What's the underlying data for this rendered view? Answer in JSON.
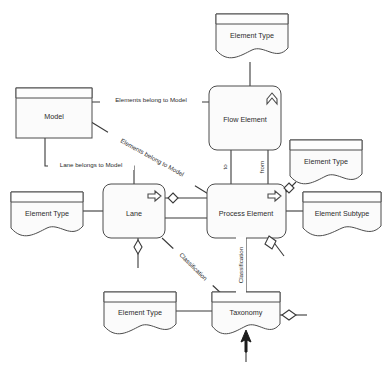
{
  "diagram": {
    "background_color": "#ffffff",
    "line_color": "#3a3a3a",
    "node_fill_color": "#fbfbfb",
    "text_color": "#2b2b2b",
    "nodes": [
      {
        "id": "element-type-top",
        "label": "Element Type",
        "shape": "document-note",
        "x": 216,
        "y": 14,
        "w": 72,
        "h": 46
      },
      {
        "id": "model",
        "label": "Model",
        "shape": "rectangle",
        "x": 16,
        "y": 88,
        "w": 76,
        "h": 50
      },
      {
        "id": "flow-element",
        "label": "Flow Element",
        "shape": "rounded-rect",
        "x": 209,
        "y": 86,
        "w": 72,
        "h": 64,
        "icon": "chevron-up-icon"
      },
      {
        "id": "element-type-right",
        "label": "Element Type",
        "shape": "document-note",
        "x": 290,
        "y": 140,
        "w": 72,
        "h": 46
      },
      {
        "id": "element-type-left",
        "label": "Element Type",
        "shape": "document-note",
        "x": 11,
        "y": 192,
        "w": 72,
        "h": 46
      },
      {
        "id": "lane",
        "label": "Lane",
        "shape": "rounded-rect",
        "x": 103,
        "y": 184,
        "w": 62,
        "h": 54,
        "icon": "arrow-right-icon"
      },
      {
        "id": "process-element",
        "label": "Process Element",
        "shape": "rounded-rect",
        "x": 207,
        "y": 184,
        "w": 79,
        "h": 54,
        "icon": "arrow-right-icon"
      },
      {
        "id": "element-subtype",
        "label": "Element Subtype",
        "shape": "document-note",
        "x": 303,
        "y": 192,
        "w": 78,
        "h": 46
      },
      {
        "id": "element-type-bottom",
        "label": "Element Type",
        "shape": "document-note",
        "x": 104,
        "y": 292,
        "w": 72,
        "h": 44
      },
      {
        "id": "taxonomy",
        "label": "Taxonomy",
        "shape": "document-note",
        "x": 212,
        "y": 292,
        "w": 68,
        "h": 44
      }
    ],
    "edges": [
      {
        "id": "model-flow",
        "label": "Elements belong to Model",
        "from": "model",
        "to": "flow-element",
        "style": "straight-horizontal"
      },
      {
        "id": "model-process",
        "label": "Elements belong to Model",
        "from": "model",
        "to": "process-element",
        "style": "diagonal",
        "rotation": 29
      },
      {
        "id": "model-lane",
        "label": "Lane belongs to Model",
        "from": "model",
        "to": "lane",
        "style": "orthogonal"
      },
      {
        "id": "flow-process-to",
        "label": "to",
        "from": "flow-element",
        "to": "process-element",
        "style": "vertical",
        "rotation": -90
      },
      {
        "id": "flow-process-from",
        "label": "from",
        "from": "flow-element",
        "to": "process-element",
        "style": "vertical",
        "rotation": -90
      },
      {
        "id": "lane-taxonomy",
        "label": "Classification",
        "from": "lane",
        "to": "taxonomy",
        "style": "diagonal",
        "rotation": 45
      },
      {
        "id": "process-taxonomy",
        "label": "Classification",
        "from": "process-element",
        "to": "taxonomy",
        "style": "vertical",
        "rotation": -90
      },
      {
        "id": "lane-process-upper",
        "label": "",
        "from": "lane",
        "to": "process-element",
        "style": "straight-horizontal"
      },
      {
        "id": "lane-process-lower",
        "label": "",
        "from": "lane",
        "to": "process-element",
        "style": "straight-horizontal"
      },
      {
        "id": "elementtype-left-lane",
        "label": "",
        "from": "element-type-left",
        "to": "lane",
        "style": "straight-horizontal"
      },
      {
        "id": "process-subtype",
        "label": "",
        "from": "process-element",
        "to": "element-subtype",
        "style": "straight-horizontal"
      },
      {
        "id": "elementtype-top-flow",
        "label": "",
        "from": "element-type-top",
        "to": "flow-element",
        "style": "vertical"
      },
      {
        "id": "elementtype-right-proc",
        "label": "",
        "from": "element-type-right",
        "to": "process-element",
        "style": "diagonal"
      },
      {
        "id": "elementtype-bot-taxon",
        "label": "",
        "from": "element-type-bottom",
        "to": "taxonomy",
        "style": "straight-horizontal"
      }
    ],
    "markers": [
      {
        "id": "diamond-lane-process",
        "type": "hollow-diamond",
        "x": 173,
        "y": 198
      },
      {
        "id": "diamond-lane-bottom",
        "type": "hollow-diamond",
        "x": 138,
        "y": 246
      },
      {
        "id": "diamond-process-right",
        "type": "hollow-diamond",
        "x": 270,
        "y": 242
      },
      {
        "id": "diamond-right-note",
        "type": "hollow-diamond",
        "x": 289,
        "y": 188
      },
      {
        "id": "diamond-taxonomy",
        "type": "hollow-diamond",
        "x": 289,
        "y": 315
      },
      {
        "id": "arrow-taxonomy-bottom",
        "type": "solid-arrow",
        "x": 246,
        "y": 340
      }
    ]
  }
}
